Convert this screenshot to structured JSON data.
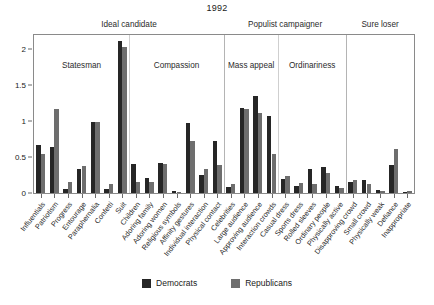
{
  "chart_data": {
    "type": "bar",
    "title": "1992",
    "xlabel": "",
    "ylabel": "",
    "ylim": [
      0,
      2.2
    ],
    "yticks": [
      0,
      0.5,
      1,
      1.5,
      2
    ],
    "ytick_labels": [
      "0",
      "0.5",
      "1",
      "1.5",
      "2"
    ],
    "grid": false,
    "legend_position": "bottom",
    "series": [
      {
        "name": "Democrats",
        "color": "#262626",
        "values": [
          0.67,
          0.64,
          0.05,
          0.33,
          0.99,
          0.05,
          2.12,
          0.4,
          0.21,
          0.42,
          0.03,
          0.97,
          0.25,
          0.73,
          0.09,
          1.18,
          1.35,
          1.07,
          0.2,
          0.1,
          0.33,
          0.36,
          0.1,
          0.16,
          0.18,
          0.04,
          0.39,
          0.02
        ]
      },
      {
        "name": "Republicans",
        "color": "#6e6e6e",
        "values": [
          0.55,
          1.17,
          0.16,
          0.38,
          0.99,
          0.13,
          2.03,
          0.15,
          0.15,
          0.4,
          0.02,
          0.72,
          0.34,
          0.39,
          0.13,
          1.17,
          1.12,
          0.55,
          0.23,
          0.14,
          0.12,
          0.28,
          0.07,
          0.18,
          0.13,
          0.03,
          0.61,
          0.03
        ]
      }
    ],
    "categories": [
      "Influentials",
      "Patriotism",
      "Progress",
      "Entourage",
      "Paraphernalia",
      "Confetti",
      "Suit",
      "Children",
      "Adoring family",
      "Adoring women",
      "Religious symbols",
      "Affinity gestures",
      "Individual interaction",
      "Physical contact",
      "Celebrities",
      "Large audience",
      "Approving audience",
      "Interaction crowds",
      "Casual dress",
      "Sports dress",
      "Rolled sleeves",
      "Ordinary people",
      "Physically active",
      "Disapproving crowd",
      "Small crowd",
      "Physically weak",
      "Defiance",
      "Inappropriate"
    ],
    "groups": [
      {
        "label": "Statesman",
        "start": 0,
        "count": 7
      },
      {
        "label": "Compassion",
        "start": 7,
        "count": 7
      },
      {
        "label": "Mass appeal",
        "start": 14,
        "count": 4
      },
      {
        "label": "Ordinariness",
        "start": 18,
        "count": 5
      },
      {
        "label": "",
        "start": 23,
        "count": 5
      }
    ],
    "supergroups": [
      {
        "label": "Ideal candidate",
        "start": 0,
        "count": 14
      },
      {
        "label": "Populist campaigner",
        "start": 14,
        "count": 9
      },
      {
        "label": "Sure loser",
        "start": 23,
        "count": 5
      }
    ]
  },
  "legend": {
    "items": [
      {
        "label": "Democrats",
        "color": "#262626"
      },
      {
        "label": "Republicans",
        "color": "#6e6e6e"
      }
    ]
  }
}
